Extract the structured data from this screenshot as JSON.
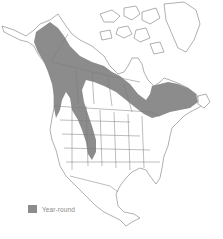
{
  "map": {
    "title": "",
    "region": "North America",
    "colors": {
      "range": "#8c8c8c",
      "outline": "#7a7a7a",
      "land": "#ffffff",
      "background": "#ffffff"
    }
  },
  "legend": {
    "items": [
      {
        "label": "Year-round",
        "color": "#8c8c8c"
      }
    ]
  }
}
